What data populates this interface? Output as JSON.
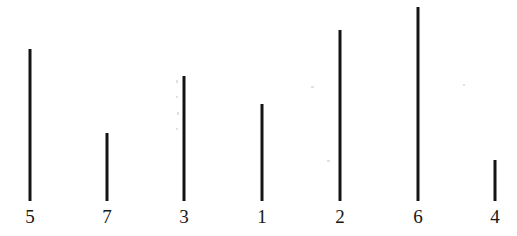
{
  "figure": {
    "background_color": "#ffffff",
    "ink_color": "#141414",
    "label_color": "#161616",
    "width": 517,
    "height": 236,
    "baseline_y": 201,
    "stroke_width": 3
  },
  "chart_data": {
    "type": "bar",
    "orientation": "vertical",
    "title": "",
    "subtitle": "",
    "xlabel": "",
    "ylabel": "",
    "grid": false,
    "legend": null,
    "axis_visible": false,
    "categories": [
      "5",
      "7",
      "3",
      "1",
      "2",
      "6",
      "4"
    ],
    "values": [
      152,
      68,
      125,
      97,
      171,
      194,
      41
    ],
    "units": "px",
    "ylim": [
      0,
      200
    ],
    "xlim": [
      0,
      517
    ],
    "baseline_y": 201,
    "x_positions": [
      30,
      107,
      184,
      262,
      340,
      418,
      495
    ],
    "top_y": [
      49,
      133,
      76,
      104,
      30,
      7,
      160
    ],
    "bars": [
      {
        "label": "5",
        "x": 30,
        "top": 49,
        "height": 152,
        "rank_by_length": 3
      },
      {
        "label": "7",
        "x": 107,
        "top": 133,
        "height": 68,
        "rank_by_length": 6
      },
      {
        "label": "3",
        "x": 184,
        "top": 76,
        "height": 125,
        "rank_by_length": 4
      },
      {
        "label": "1",
        "x": 262,
        "top": 104,
        "height": 97,
        "rank_by_length": 5
      },
      {
        "label": "2",
        "x": 340,
        "top": 30,
        "height": 171,
        "rank_by_length": 2
      },
      {
        "label": "6",
        "x": 418,
        "top": 7,
        "height": 194,
        "rank_by_length": 1
      },
      {
        "label": "4",
        "x": 495,
        "top": 160,
        "height": 41,
        "rank_by_length": 7
      }
    ],
    "longest": "6",
    "shortest": "4",
    "order_by_length_descending": [
      "6",
      "2",
      "5",
      "3",
      "1",
      "7",
      "4"
    ],
    "annotations": []
  },
  "artifacts": [
    {
      "name": "scan-speck",
      "x": 176,
      "y": 80,
      "w": 2,
      "h": 3
    },
    {
      "name": "scan-speck",
      "x": 176,
      "y": 96,
      "w": 2,
      "h": 2
    },
    {
      "name": "scan-speck",
      "x": 177,
      "y": 112,
      "w": 2,
      "h": 3
    },
    {
      "name": "scan-speck",
      "x": 176,
      "y": 128,
      "w": 2,
      "h": 2
    },
    {
      "name": "scan-speck",
      "x": 311,
      "y": 86,
      "w": 3,
      "h": 2
    },
    {
      "name": "scan-speck",
      "x": 327,
      "y": 160,
      "w": 3,
      "h": 2
    },
    {
      "name": "scan-speck",
      "x": 463,
      "y": 84,
      "w": 2,
      "h": 2
    }
  ]
}
